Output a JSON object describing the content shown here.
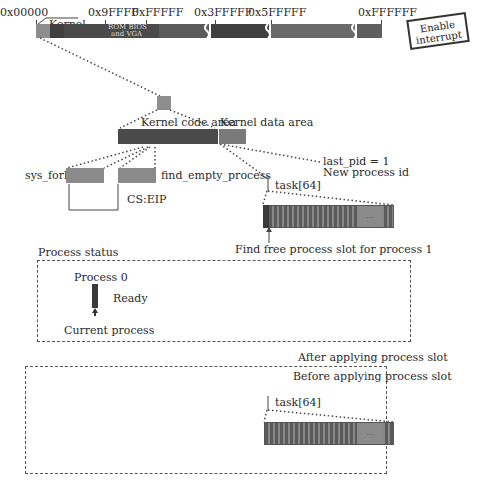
{
  "memory_map": {
    "addresses": [
      {
        "label": "0x00000",
        "x": 2
      },
      {
        "label": "0x9FFFF",
        "x": 90
      },
      {
        "label": "0xFFFFF",
        "x": 132
      },
      {
        "label": "0x3FFFFF",
        "x": 197
      },
      {
        "label": "0x5FFFFF",
        "x": 251
      },
      {
        "label": "0xFFFFFF",
        "x": 358
      }
    ],
    "kernel_label": "Kernel",
    "rom_label_line1": "ROM BIOS",
    "rom_label_line2": "and VGA",
    "stamp_line1": "Enable",
    "stamp_line2": "interrupt"
  },
  "kernel_areas": {
    "code_label": "Kernel code area",
    "data_label": "Kernel data area"
  },
  "functions": {
    "sys_fork": "sys_fork",
    "find_empty_process": "find_empty_process",
    "cs_eip": "CS:EIP"
  },
  "pid": {
    "line1": "last_pid = 1",
    "line2": "New process id"
  },
  "task_array_top": {
    "label": "task[64]",
    "caption": "Find free process slot for process 1",
    "ellipsis": "..."
  },
  "process_status": {
    "title": "Process status",
    "process_label": "Process 0",
    "state": "Ready",
    "pointer_label": "Current process"
  },
  "slot_states": {
    "after": "After applying process slot",
    "before": "Before applying process slot"
  },
  "task_array_bottom": {
    "label": "task[64]",
    "ellipsis": "..."
  },
  "colors": {
    "dark": "#3f3f3f",
    "mid": "#5e5e5e",
    "light": "#8d8d8d"
  }
}
